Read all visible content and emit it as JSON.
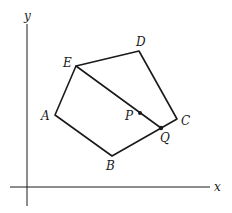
{
  "diagram": {
    "type": "pentagon-on-coordinate-axes",
    "axes": {
      "x_label": "x",
      "y_label": "y"
    },
    "vertices": [
      {
        "name": "A",
        "label": "A",
        "x": 55,
        "y": 115
      },
      {
        "name": "B",
        "label": "B",
        "x": 112,
        "y": 156
      },
      {
        "name": "C",
        "label": "C",
        "x": 177,
        "y": 119
      },
      {
        "name": "D",
        "label": "D",
        "x": 139,
        "y": 51
      },
      {
        "name": "E",
        "label": "E",
        "x": 76,
        "y": 66
      }
    ],
    "points": [
      {
        "name": "P",
        "label": "P",
        "x": 140,
        "y": 114,
        "on": "segment EQ"
      },
      {
        "name": "Q",
        "label": "Q",
        "x": 161,
        "y": 128,
        "on": "segment BC"
      }
    ],
    "segments": [
      {
        "from": "A",
        "to": "B"
      },
      {
        "from": "B",
        "to": "C"
      },
      {
        "from": "C",
        "to": "D"
      },
      {
        "from": "D",
        "to": "E"
      },
      {
        "from": "E",
        "to": "A"
      },
      {
        "from": "E",
        "to": "Q"
      }
    ]
  }
}
